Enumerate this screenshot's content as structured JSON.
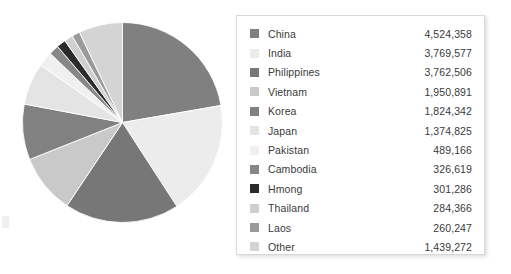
{
  "chart_data": {
    "type": "pie",
    "title": "",
    "xlabel": "",
    "ylabel": "",
    "start_angle_deg": 0,
    "direction": "clockwise",
    "legend_position": "right",
    "grid": false,
    "categories": [
      "China",
      "India",
      "Philippines",
      "Vietnam",
      "Korea",
      "Japan",
      "Pakistan",
      "Cambodia",
      "Hmong",
      "Thailand",
      "Laos",
      "Other"
    ],
    "values": [
      4524358,
      3769577,
      3762506,
      1950891,
      1824342,
      1374825,
      489166,
      326619,
      301286,
      284366,
      260247,
      1439272
    ],
    "value_labels": [
      "4,524,358",
      "3,769,577",
      "3,762,506",
      "1,950,891",
      "1,824,342",
      "1,374,825",
      "489,166",
      "326,619",
      "301,286",
      "284,366",
      "260,247",
      "1,439,272"
    ],
    "colors": [
      "#808080",
      "#ececec",
      "#777777",
      "#c9c9c9",
      "#818181",
      "#e4e4e4",
      "#f0f0f0",
      "#878787",
      "#2b2b2b",
      "#cfcfcf",
      "#9a9a9a",
      "#d4d4d4"
    ],
    "total": 21907459
  },
  "legend": {
    "items": [
      {
        "label": "China",
        "value": "4,524,358",
        "color": "#808080"
      },
      {
        "label": "India",
        "value": "3,769,577",
        "color": "#ececec"
      },
      {
        "label": "Philippines",
        "value": "3,762,506",
        "color": "#777777"
      },
      {
        "label": "Vietnam",
        "value": "1,950,891",
        "color": "#c9c9c9"
      },
      {
        "label": "Korea",
        "value": "1,824,342",
        "color": "#818181"
      },
      {
        "label": "Japan",
        "value": "1,374,825",
        "color": "#e4e4e4"
      },
      {
        "label": "Pakistan",
        "value": "489,166",
        "color": "#f0f0f0"
      },
      {
        "label": "Cambodia",
        "value": "326,619",
        "color": "#878787"
      },
      {
        "label": "Hmong",
        "value": "301,286",
        "color": "#2b2b2b"
      },
      {
        "label": "Thailand",
        "value": "284,366",
        "color": "#cfcfcf"
      },
      {
        "label": "Laos",
        "value": "260,247",
        "color": "#9a9a9a"
      },
      {
        "label": "Other",
        "value": "1,439,272",
        "color": "#d4d4d4"
      }
    ]
  }
}
